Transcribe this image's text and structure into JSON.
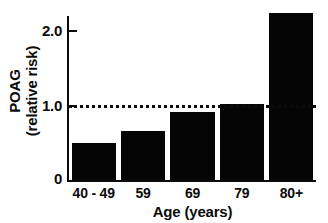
{
  "chart_data": {
    "type": "bar",
    "title": "",
    "categories": [
      "40 - 49",
      "59",
      "69",
      "79",
      "80+"
    ],
    "values": [
      0.49,
      0.65,
      0.91,
      1.02,
      2.23
    ],
    "xlabel": "Age (years)",
    "ylabel_line1": "POAG",
    "ylabel_line2": "(relative risk)",
    "ylim": [
      0,
      2.35
    ],
    "yticks": [
      "0",
      "1.0",
      "2.0"
    ],
    "ytick_values": [
      0,
      1.0,
      2.0
    ],
    "grid": false,
    "legend": false,
    "annotations": [
      {
        "type": "reference-line",
        "value": 1.0,
        "style": "dotted",
        "label": ""
      }
    ],
    "bar_color": "#050505",
    "axis_color": "#0b0b0b"
  }
}
